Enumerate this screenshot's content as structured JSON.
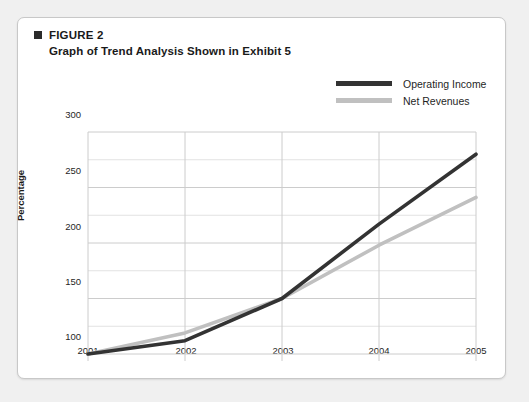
{
  "figure": {
    "bullet": "square-bullet",
    "label": "FIGURE 2",
    "subtitle": "Graph of Trend Analysis Shown in Exhibit 5"
  },
  "colors": {
    "operating_income": "#333333",
    "net_revenues": "#c0c0c0",
    "grid_major": "#cccccc",
    "grid_minor": "#e2e2e2",
    "card_border": "#c8c8c8",
    "page_background": "#f0f0f0"
  },
  "chart_data": {
    "type": "line",
    "title": "Graph of Trend Analysis Shown in Exhibit 5",
    "xlabel": "",
    "ylabel": "Percentage",
    "categories": [
      "2001",
      "2002",
      "2003",
      "2004",
      "2005"
    ],
    "x": [
      2001,
      2002,
      2003,
      2004,
      2005
    ],
    "series": [
      {
        "name": "Operating Income",
        "color": "#333333",
        "values": [
          100,
          112,
          150,
          217,
          280
        ]
      },
      {
        "name": "Net Revenues",
        "color": "#c0c0c0",
        "values": [
          100,
          119,
          150,
          198,
          241
        ]
      }
    ],
    "ylim": [
      100,
      300
    ],
    "ytick_labels": [
      "100",
      "150",
      "200",
      "250",
      "300"
    ],
    "ytick_values": [
      100,
      150,
      200,
      250,
      300
    ],
    "minor_gridline_step": 25,
    "grid": true,
    "legend_position": "top-right"
  }
}
